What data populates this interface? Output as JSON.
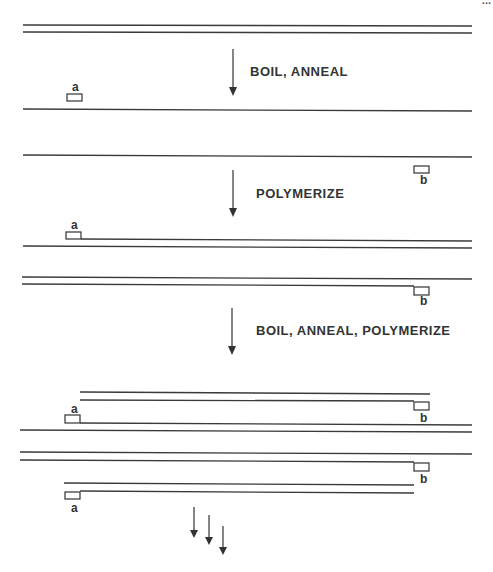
{
  "diagram": {
    "type": "pcr-amplification-schematic",
    "steps": [
      {
        "label": "BOIL, ANNEAL"
      },
      {
        "label": "POLYMERIZE"
      },
      {
        "label": "BOIL, ANNEAL, POLYMERIZE"
      }
    ],
    "primers": {
      "a": "a",
      "b": "b"
    },
    "page_number_fragment": "..."
  },
  "colors": {
    "ink": "#333333",
    "background": "#ffffff"
  }
}
